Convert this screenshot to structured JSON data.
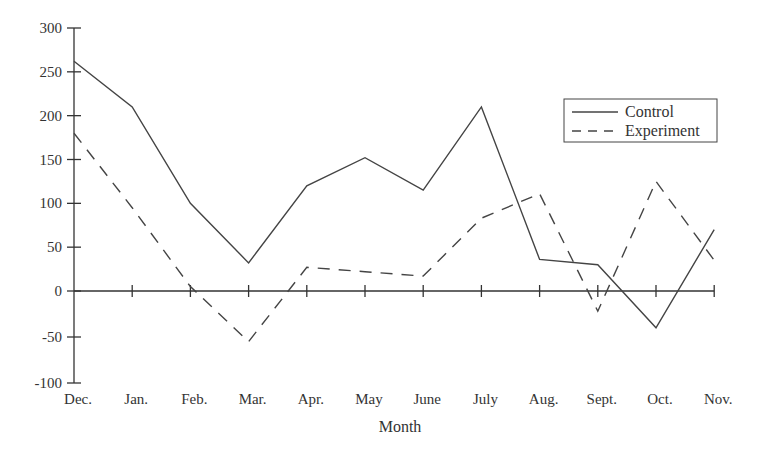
{
  "chart_data": {
    "type": "line",
    "title": "",
    "xlabel": "Month",
    "ylabel": "",
    "categories": [
      "Dec.",
      "Jan.",
      "Feb.",
      "Mar.",
      "Apr.",
      "May",
      "June",
      "July",
      "Aug.",
      "Sept.",
      "Oct.",
      "Nov."
    ],
    "series": [
      {
        "name": "Control",
        "style": "solid",
        "values": [
          262,
          210,
          100,
          32,
          120,
          152,
          115,
          210,
          36,
          30,
          -40,
          70
        ]
      },
      {
        "name": "Experiment",
        "style": "dashed",
        "values": [
          180,
          95,
          5,
          -55,
          27,
          22,
          17,
          83,
          111,
          -22,
          125,
          35
        ]
      }
    ],
    "ylim": [
      -100,
      300
    ],
    "yticks": [
      300,
      250,
      200,
      150,
      100,
      50,
      0,
      -50,
      -100
    ],
    "grid": false,
    "legend_position": "upper right",
    "colors": {
      "line": "#444444",
      "axis": "#333333"
    }
  }
}
